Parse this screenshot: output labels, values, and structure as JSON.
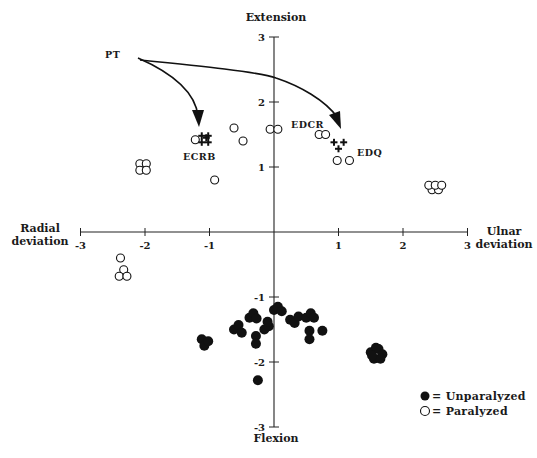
{
  "chart_data": {
    "type": "scatter",
    "title": "",
    "axes": {
      "top_label": "Extension",
      "bottom_label": "Flexion",
      "left_label_line1": "Radial",
      "left_label_line2": "deviation",
      "right_label_line1": "Ulnar",
      "right_label_line2": "deviation",
      "xlim": [
        -3,
        3
      ],
      "ylim": [
        -3,
        3
      ],
      "x_ticks": [
        -3,
        -2,
        -1,
        1,
        2,
        3
      ],
      "y_ticks": [
        3,
        2,
        1,
        -1,
        -2,
        -3
      ],
      "x_tick_labels": [
        "-3",
        "-2",
        "-1",
        "1",
        "2",
        "3"
      ],
      "y_tick_labels": [
        "3",
        "2",
        "1",
        "-1",
        "-2",
        "-3"
      ],
      "grid": false,
      "axes_cross_at_origin": true
    },
    "series": [
      {
        "name": "Unparalyzed",
        "marker": "filled-circle",
        "points": [
          [
            -1.12,
            -1.65
          ],
          [
            -1.08,
            -1.75
          ],
          [
            -1.02,
            -1.68
          ],
          [
            -0.62,
            -1.5
          ],
          [
            -0.55,
            -1.43
          ],
          [
            -0.5,
            -1.55
          ],
          [
            -0.38,
            -1.32
          ],
          [
            -0.32,
            -1.25
          ],
          [
            -0.27,
            -1.33
          ],
          [
            -0.28,
            -1.6
          ],
          [
            -0.28,
            -1.72
          ],
          [
            -0.15,
            -1.5
          ],
          [
            -0.08,
            -1.45
          ],
          [
            -0.1,
            -1.38
          ],
          [
            0.0,
            -1.2
          ],
          [
            0.06,
            -1.15
          ],
          [
            0.12,
            -1.22
          ],
          [
            0.25,
            -1.35
          ],
          [
            0.32,
            -1.4
          ],
          [
            0.38,
            -1.3
          ],
          [
            0.5,
            -1.32
          ],
          [
            0.57,
            -1.25
          ],
          [
            0.62,
            -1.32
          ],
          [
            0.55,
            -1.52
          ],
          [
            0.55,
            -1.65
          ],
          [
            0.75,
            -1.52
          ],
          [
            -0.25,
            -2.28
          ],
          [
            1.5,
            -1.85
          ],
          [
            1.55,
            -1.95
          ],
          [
            1.62,
            -1.8
          ],
          [
            1.68,
            -1.88
          ],
          [
            1.58,
            -1.78
          ],
          [
            1.65,
            -1.95
          ],
          [
            1.52,
            -1.9
          ]
        ]
      },
      {
        "name": "Paralyzed",
        "marker": "open-circle",
        "points": [
          [
            -1.22,
            1.42
          ],
          [
            -2.08,
            1.05
          ],
          [
            -1.98,
            1.05
          ],
          [
            -2.08,
            0.95
          ],
          [
            -1.98,
            0.95
          ],
          [
            -0.62,
            1.6
          ],
          [
            -0.48,
            1.4
          ],
          [
            -0.92,
            0.8
          ],
          [
            -0.06,
            1.58
          ],
          [
            0.06,
            1.58
          ],
          [
            0.7,
            1.5
          ],
          [
            0.8,
            1.5
          ],
          [
            0.98,
            1.1
          ],
          [
            1.17,
            1.1
          ],
          [
            2.45,
            0.65
          ],
          [
            2.55,
            0.65
          ],
          [
            2.4,
            0.72
          ],
          [
            2.5,
            0.72
          ],
          [
            2.6,
            0.72
          ],
          [
            -2.38,
            -0.4
          ],
          [
            -2.33,
            -0.58
          ],
          [
            -2.4,
            -0.68
          ],
          [
            -2.28,
            -0.68
          ]
        ]
      },
      {
        "name": "Tendon transfer (PT donor)",
        "marker": "circled-plus / plus",
        "points": [
          [
            -1.12,
            1.48
          ],
          [
            -1.02,
            1.48
          ],
          [
            -1.12,
            1.38
          ],
          [
            -1.02,
            1.38
          ],
          [
            -1.05,
            1.45
          ],
          [
            0.93,
            1.38
          ],
          [
            1.08,
            1.38
          ],
          [
            1.0,
            1.28
          ]
        ]
      }
    ],
    "annotations": [
      {
        "text": "PT",
        "x": -2.0,
        "y": 2.4
      },
      {
        "text": "ECRB",
        "x": -1.1,
        "y": 1.2,
        "note": "arrow from PT"
      },
      {
        "text": "EDCR",
        "x": 0.6,
        "y": 1.62
      },
      {
        "text": "EDQ",
        "x": 1.3,
        "y": 1.25,
        "note": "arrow from PT"
      }
    ],
    "legend": {
      "position": "lower-right",
      "entries": [
        {
          "symbol": "filled-circle",
          "label": "= Unparalyzed"
        },
        {
          "symbol": "open-circle",
          "label": "= Paralyzed"
        }
      ]
    }
  },
  "labels": {
    "top": "Extension",
    "bottom": "Flexion",
    "left1": "Radial",
    "left2": "deviation",
    "right1": "Ulnar",
    "right2": "deviation",
    "pt": "PT",
    "ecrb": "ECRB",
    "edcr": "EDCR",
    "edq": "EDQ",
    "legend_unparalyzed": "= Unparalyzed",
    "legend_paralyzed": "= Paralyzed"
  }
}
